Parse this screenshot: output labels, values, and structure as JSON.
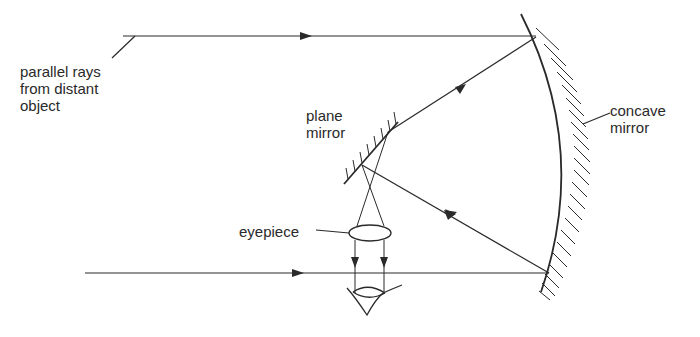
{
  "diagram": {
    "labels": {
      "parallel_rays": "parallel rays\nfrom distant\nobject",
      "plane_mirror": "plane\nmirror",
      "concave_mirror": "concave\nmirror",
      "eyepiece": "eyepiece"
    },
    "colors": {
      "line": "#2a2a2a",
      "background": "#ffffff"
    }
  }
}
